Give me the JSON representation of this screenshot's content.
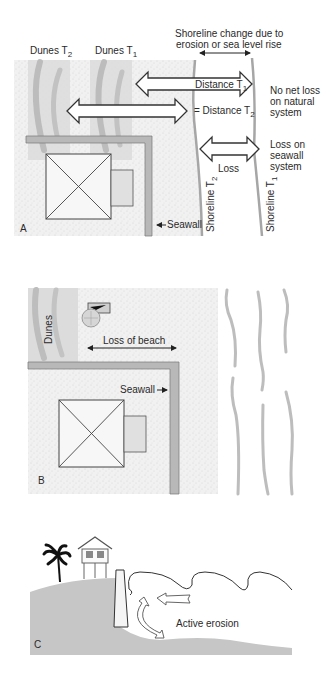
{
  "panel_a": {
    "letter": "A",
    "dunes_t2": "Dunes T",
    "dunes_t2_sub": "2",
    "dunes_t1": "Dunes T",
    "dunes_t1_sub": "1",
    "shoreline_change_line1": "Shoreline change due to",
    "shoreline_change_line2": "erosion or sea level rise",
    "distance_t1": "Distance T",
    "distance_t1_sub": "1",
    "distance_t2": "= Distance T",
    "distance_t2_sub": "2",
    "no_net_loss_line1": "No net loss",
    "no_net_loss_line2": "on natural",
    "no_net_loss_line3": "system",
    "loss": "Loss",
    "loss_seawall_line1": "Loss on",
    "loss_seawall_line2": "seawall",
    "loss_seawall_line3": "system",
    "seawall": "Seawall",
    "shoreline_t2": "Shoreline T",
    "shoreline_t2_sub": "2",
    "shoreline_t1": "Shoreline T",
    "shoreline_t1_sub": "1"
  },
  "panel_b": {
    "letter": "B",
    "dunes": "Dunes",
    "loss_of_beach": "Loss of beach",
    "seawall": "Seawall"
  },
  "panel_c": {
    "letter": "C",
    "active_erosion": "Active erosion"
  },
  "colors": {
    "sand": "#f0f0f0",
    "dune": "#d9d9d9",
    "dune_streak": "#bdbdbd",
    "seawall": "#b5b5b5",
    "shoreline": "#a8a8a8",
    "ground": "#c4c4c4",
    "line": "#3a3a3a"
  }
}
